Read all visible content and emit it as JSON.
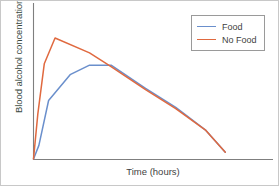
{
  "chart_data": {
    "type": "line",
    "title": "",
    "xlabel": "Time (hours)",
    "ylabel": "Blood alcohol concentration (g/dL)",
    "grid": false,
    "legend_position": "top-right",
    "xlim": [
      0,
      10
    ],
    "ylim": [
      0,
      1
    ],
    "xticks": [],
    "yticks": [],
    "series": [
      {
        "name": "Food",
        "color": "#6a8fcc",
        "x": [
          0.0,
          0.25,
          0.7,
          1.7,
          2.6,
          3.6,
          5.2,
          6.6,
          8.0,
          8.9
        ],
        "y": [
          0.0,
          0.1,
          0.43,
          0.62,
          0.69,
          0.69,
          0.52,
          0.38,
          0.21,
          0.05
        ]
      },
      {
        "name": "No Food",
        "color": "#e0693f",
        "x": [
          0.0,
          0.2,
          0.5,
          1.0,
          2.6,
          3.6,
          5.2,
          6.6,
          8.0,
          8.9
        ],
        "y": [
          0.0,
          0.33,
          0.7,
          0.89,
          0.78,
          0.68,
          0.51,
          0.37,
          0.21,
          0.05
        ]
      }
    ]
  },
  "legend": {
    "items": [
      {
        "label": "Food",
        "color": "#6a8fcc"
      },
      {
        "label": "No Food",
        "color": "#e0693f"
      }
    ]
  },
  "axes": {
    "x_label": "Time (hours)",
    "y_label": "Blood alcohol concentration (g/dL)"
  }
}
